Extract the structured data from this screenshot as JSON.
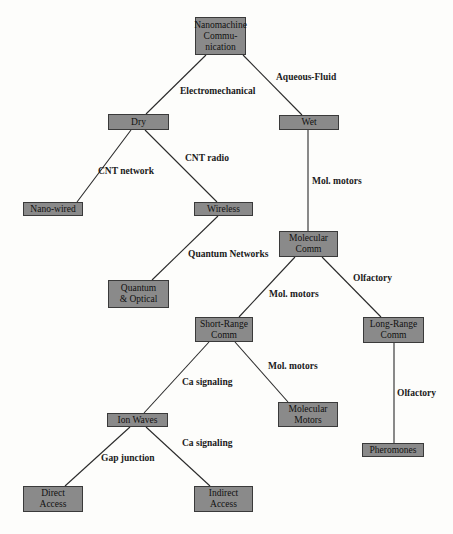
{
  "diagram": {
    "type": "tree",
    "nodes": [
      {
        "id": "root",
        "label": "Nanomachine\nCommu-\nnication",
        "x": 195,
        "y": 17,
        "w": 51,
        "h": 38
      },
      {
        "id": "dry",
        "label": "Dry",
        "x": 108,
        "y": 114,
        "w": 61,
        "h": 16
      },
      {
        "id": "wet",
        "label": "Wet",
        "x": 279,
        "y": 115,
        "w": 60,
        "h": 15
      },
      {
        "id": "nanowired",
        "label": "Nano-wired",
        "x": 23,
        "y": 202,
        "w": 60,
        "h": 14
      },
      {
        "id": "wireless",
        "label": "Wireless",
        "x": 194,
        "y": 202,
        "w": 59,
        "h": 14
      },
      {
        "id": "molcomm",
        "label": "Molecular\nComm",
        "x": 279,
        "y": 231,
        "w": 59,
        "h": 26
      },
      {
        "id": "quantum",
        "label": "Quantum\n& Optical",
        "x": 108,
        "y": 280,
        "w": 61,
        "h": 28
      },
      {
        "id": "shortrange",
        "label": "Short-Range\nComm",
        "x": 195,
        "y": 317,
        "w": 58,
        "h": 25
      },
      {
        "id": "longrange",
        "label": "Long-Range\nComm",
        "x": 363,
        "y": 317,
        "w": 61,
        "h": 26
      },
      {
        "id": "ionwaves",
        "label": "Ion Waves",
        "x": 107,
        "y": 413,
        "w": 61,
        "h": 14
      },
      {
        "id": "molmotors",
        "label": "Molecular\nMotors",
        "x": 278,
        "y": 402,
        "w": 60,
        "h": 25
      },
      {
        "id": "pheromones",
        "label": "Pheromones",
        "x": 362,
        "y": 443,
        "w": 62,
        "h": 14
      },
      {
        "id": "direct",
        "label": "Direct\nAccess",
        "x": 23,
        "y": 486,
        "w": 60,
        "h": 26
      },
      {
        "id": "indirect",
        "label": "Indirect\nAccess",
        "x": 194,
        "y": 486,
        "w": 59,
        "h": 26
      }
    ],
    "edges": [
      {
        "from": "root",
        "to": "dry",
        "label": "Electromechanical",
        "x1": 206,
        "y1": 55,
        "x2": 146,
        "y2": 114,
        "lx": 180,
        "ly": 86
      },
      {
        "from": "root",
        "to": "wet",
        "label": "Aqueous-Fluid",
        "x1": 243,
        "y1": 55,
        "x2": 302,
        "y2": 115,
        "lx": 276,
        "ly": 72
      },
      {
        "from": "dry",
        "to": "nanowired",
        "label": "CNT network",
        "x1": 131,
        "y1": 130,
        "x2": 77,
        "y2": 202,
        "lx": 98,
        "ly": 166
      },
      {
        "from": "dry",
        "to": "wireless",
        "label": "CNT radio",
        "x1": 145,
        "y1": 130,
        "x2": 217,
        "y2": 202,
        "lx": 185,
        "ly": 153
      },
      {
        "from": "wet",
        "to": "molcomm",
        "label": "Mol. motors",
        "x1": 308,
        "y1": 130,
        "x2": 308,
        "y2": 231,
        "lx": 312,
        "ly": 176
      },
      {
        "from": "wireless",
        "to": "quantum",
        "label": "Quantum Networks",
        "x1": 218,
        "y1": 216,
        "x2": 152,
        "y2": 280,
        "lx": 188,
        "ly": 249
      },
      {
        "from": "molcomm",
        "to": "shortrange",
        "label": "Mol. motors",
        "x1": 295,
        "y1": 257,
        "x2": 239,
        "y2": 317,
        "lx": 269,
        "ly": 289
      },
      {
        "from": "molcomm",
        "to": "longrange",
        "label": "Olfactory",
        "x1": 322,
        "y1": 257,
        "x2": 381,
        "y2": 317,
        "lx": 353,
        "ly": 273
      },
      {
        "from": "shortrange",
        "to": "ionwaves",
        "label": "Ca signaling",
        "x1": 209,
        "y1": 342,
        "x2": 144,
        "y2": 413,
        "lx": 182,
        "ly": 377
      },
      {
        "from": "shortrange",
        "to": "molmotors",
        "label": "Mol. motors",
        "x1": 235,
        "y1": 342,
        "x2": 288,
        "y2": 402,
        "lx": 268,
        "ly": 361
      },
      {
        "from": "longrange",
        "to": "pheromones",
        "label": "Olfactory",
        "x1": 394,
        "y1": 343,
        "x2": 394,
        "y2": 443,
        "lx": 397,
        "ly": 388
      },
      {
        "from": "ionwaves",
        "to": "direct",
        "label": "Gap junction",
        "x1": 130,
        "y1": 427,
        "x2": 65,
        "y2": 486,
        "lx": 101,
        "ly": 453
      },
      {
        "from": "ionwaves",
        "to": "indirect",
        "label": "Ca signaling",
        "x1": 146,
        "y1": 427,
        "x2": 210,
        "y2": 486,
        "lx": 182,
        "ly": 438
      }
    ],
    "colors": {
      "node_fill": "#8a8a8a",
      "node_border": "#3a3a3a",
      "edge": "#2a2a2a",
      "background": "#fdfdfb"
    }
  }
}
